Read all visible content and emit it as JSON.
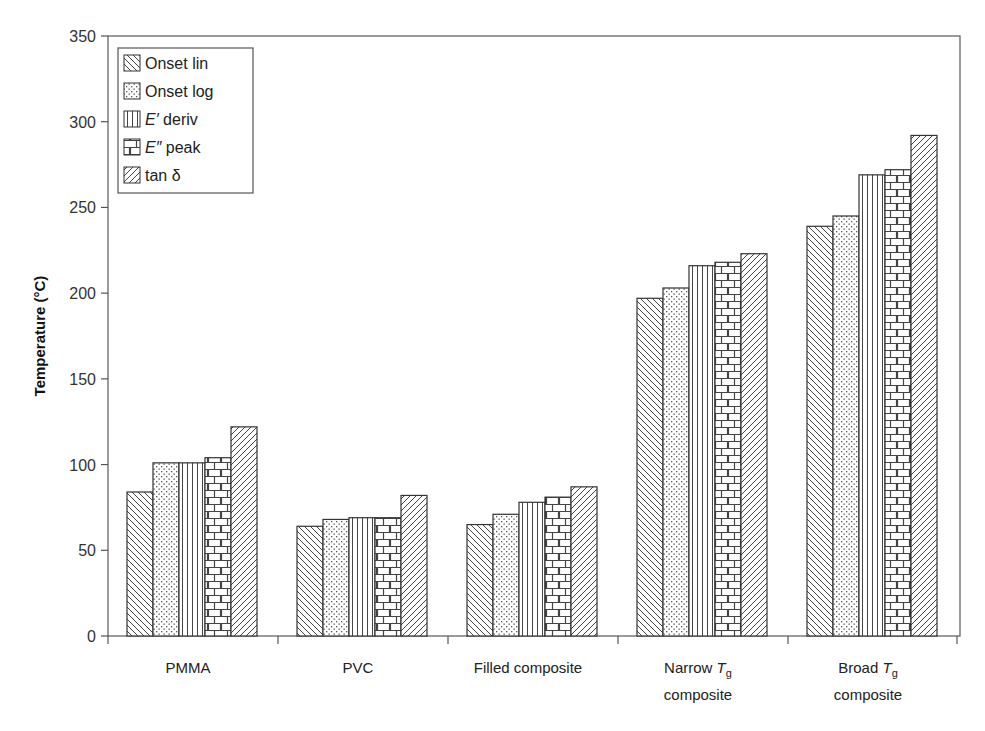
{
  "chart_data": {
    "type": "bar",
    "title": "",
    "xlabel": "",
    "ylabel": "Temperature (°C)",
    "ylim": [
      0,
      350
    ],
    "yticks": [
      0,
      50,
      100,
      150,
      200,
      250,
      300,
      350
    ],
    "grid": false,
    "legend_position": "upper-left",
    "categories": [
      {
        "line1": "PMMA",
        "line2": ""
      },
      {
        "line1": "PVC",
        "line2": ""
      },
      {
        "line1": "Filled composite",
        "line2": ""
      },
      {
        "line1": "Narrow T_g",
        "line2": "composite"
      },
      {
        "line1": "Broad T_g",
        "line2": "composite"
      }
    ],
    "category_names": [
      "PMMA",
      "PVC",
      "Filled composite",
      "Narrow Tg composite",
      "Broad Tg composite"
    ],
    "series": [
      {
        "name": "Onset lin",
        "pattern": "diag-back",
        "values": [
          84,
          64,
          65,
          197,
          239
        ]
      },
      {
        "name": "Onset log",
        "pattern": "dots",
        "values": [
          101,
          68,
          71,
          203,
          245
        ]
      },
      {
        "name": "E′ deriv",
        "pattern": "vertical",
        "values": [
          101,
          69,
          78,
          216,
          269
        ]
      },
      {
        "name": "E″ peak",
        "pattern": "brick",
        "values": [
          104,
          69,
          81,
          218,
          272
        ]
      },
      {
        "name": "tan δ",
        "pattern": "diag-fwd",
        "values": [
          122,
          82,
          87,
          223,
          292
        ]
      }
    ]
  },
  "legend": {
    "items": [
      {
        "prefix": "",
        "italic": "",
        "suffix": "Onset lin"
      },
      {
        "prefix": "",
        "italic": "",
        "suffix": "Onset log"
      },
      {
        "prefix": "",
        "italic": "E′",
        "suffix": " deriv"
      },
      {
        "prefix": "",
        "italic": "E″",
        "suffix": " peak"
      },
      {
        "prefix": "",
        "italic": "",
        "suffix": "tan δ"
      }
    ]
  },
  "axis_labels": {
    "y": "Temperature (°C)",
    "x_categories": [
      {
        "main": "PMMA",
        "italic": "",
        "sub": "",
        "line2": ""
      },
      {
        "main": "PVC",
        "italic": "",
        "sub": "",
        "line2": ""
      },
      {
        "main": "Filled composite",
        "italic": "",
        "sub": "",
        "line2": ""
      },
      {
        "main": "Narrow ",
        "italic": "T",
        "sub": "g",
        "line2": "composite"
      },
      {
        "main": "Broad ",
        "italic": "T",
        "sub": "g",
        "line2": "composite"
      }
    ]
  },
  "colors": {
    "axis": "#555555",
    "bar_stroke": "#333333",
    "pattern": "#444444",
    "background": "#ffffff"
  }
}
